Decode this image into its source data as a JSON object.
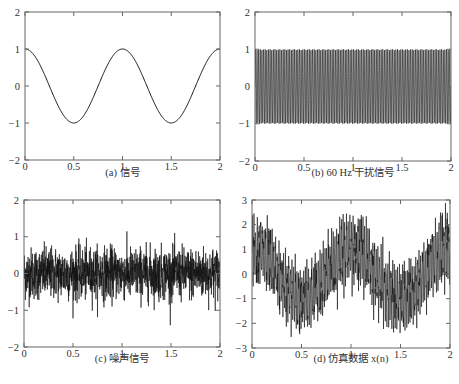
{
  "colors": {
    "axis": "#666666",
    "line": "#111111",
    "background": "#ffffff"
  },
  "chart_data": [
    {
      "id": "a",
      "type": "line",
      "caption": "(a) 信号",
      "title": "",
      "xlabel": "",
      "ylabel": "",
      "xlim": [
        0,
        2
      ],
      "ylim": [
        -2,
        2
      ],
      "xticks": [
        0,
        0.5,
        1,
        1.5,
        2
      ],
      "xtick_labels": [
        "0",
        "0.5",
        "1",
        "1.5",
        "2"
      ],
      "yticks": [
        -2,
        -1,
        0,
        1,
        2
      ],
      "ytick_labels": [
        "−2",
        "−1",
        "0",
        "1",
        "2"
      ],
      "series": [
        {
          "name": "signal",
          "formula": "cos(2*pi*1*t)",
          "amplitude": 1,
          "frequency_hz": 1
        }
      ],
      "box": {
        "x0": 25,
        "y0": 12,
        "x1": 220,
        "y1": 160
      }
    },
    {
      "id": "b",
      "type": "line",
      "caption": "(b) 60 Hz 干扰信号",
      "title": "",
      "xlabel": "",
      "ylabel": "",
      "xlim": [
        0,
        2
      ],
      "ylim": [
        -2,
        2
      ],
      "xticks": [
        0,
        0.5,
        1,
        1.5,
        2
      ],
      "xtick_labels": [
        "0",
        "0.5",
        "1",
        "1.5",
        "2"
      ],
      "yticks": [
        -2,
        -1,
        0,
        1,
        2
      ],
      "ytick_labels": [
        "−2",
        "−1",
        "0",
        "1",
        "2"
      ],
      "series": [
        {
          "name": "60 Hz interference",
          "formula": "sin(2*pi*60*t)",
          "amplitude": 1,
          "frequency_hz": 60
        }
      ],
      "box": {
        "x0": 255,
        "y0": 12,
        "x1": 451,
        "y1": 161
      }
    },
    {
      "id": "c",
      "type": "line",
      "caption": "(c) 噪声信号",
      "title": "",
      "xlabel": "",
      "ylabel": "",
      "xlim": [
        0,
        2
      ],
      "ylim": [
        -2,
        2
      ],
      "xticks": [
        0,
        0.5,
        1,
        1.5,
        2
      ],
      "xtick_labels": [
        "0",
        "0.5",
        "1",
        "1.5",
        "2"
      ],
      "yticks": [
        -2,
        -1,
        0,
        1,
        2
      ],
      "ytick_labels": [
        "−2",
        "−1",
        "0",
        "1",
        "2"
      ],
      "series": [
        {
          "name": "noise",
          "formula": "gaussian noise",
          "std": 0.35,
          "approx_range": [
            -1.5,
            1.3
          ]
        }
      ],
      "box": {
        "x0": 24,
        "y0": 200,
        "x1": 220,
        "y1": 347
      }
    },
    {
      "id": "d",
      "type": "line",
      "caption": "(d) 仿真数据 x(n)",
      "title": "",
      "xlabel": "",
      "ylabel": "",
      "xlim": [
        0,
        2
      ],
      "ylim": [
        -3,
        3
      ],
      "xticks": [
        0,
        0.5,
        1,
        1.5,
        2
      ],
      "xtick_labels": [
        "0",
        "0.5",
        "1",
        "1.5",
        "2"
      ],
      "yticks": [
        -3,
        -2,
        -1,
        0,
        1,
        2,
        3
      ],
      "ytick_labels": [
        "−3",
        "−2",
        "−1",
        "0",
        "1",
        "2",
        "3"
      ],
      "series": [
        {
          "name": "x(n)",
          "formula": "cos(2*pi*t) + sin(2*pi*60*t) + noise",
          "approx_range": [
            -2.9,
            2.9
          ]
        }
      ],
      "box": {
        "x0": 252,
        "y0": 200,
        "x1": 450,
        "y1": 348
      }
    }
  ]
}
